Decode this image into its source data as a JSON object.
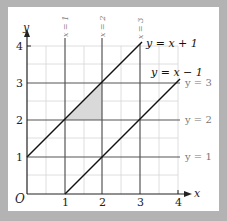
{
  "figure": {
    "axes": {
      "x_label": "x",
      "y_label": "y",
      "origin_label": "O",
      "x_ticks": [
        "1",
        "2",
        "3",
        "4"
      ],
      "y_ticks": [
        "1",
        "2",
        "3",
        "4"
      ]
    },
    "vertical_lines": [
      {
        "label": "x = 1",
        "x": 1
      },
      {
        "label": "x = 2",
        "x": 2
      },
      {
        "label": "x = 3",
        "x": 3
      }
    ],
    "horizontal_lines": [
      {
        "label": "y = 1",
        "y": 1
      },
      {
        "label": "y = 2",
        "y": 2
      },
      {
        "label": "y = 3",
        "y": 3
      }
    ],
    "diagonal_lines": [
      {
        "label": "y = x + 1"
      },
      {
        "label": "y = x − 1"
      }
    ],
    "shaded_region": {
      "vertices": [
        [
          1,
          2
        ],
        [
          2,
          2
        ],
        [
          2,
          3
        ]
      ],
      "color": "#d9d9d9"
    },
    "colors": {
      "background": "#b3b3b3",
      "panel": "#ffffff",
      "grid": "#d0d0d0",
      "lines": "#555555",
      "diagonals": "#111111",
      "label_gray": "#777777"
    }
  }
}
